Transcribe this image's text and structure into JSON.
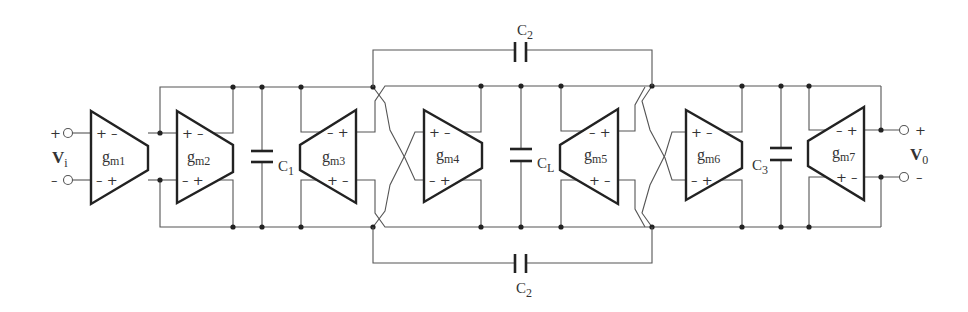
{
  "diagram": {
    "type": "circuit-schematic",
    "input": {
      "label": "V",
      "subscript": "i",
      "plus": "+",
      "minus": "–"
    },
    "output": {
      "label": "V",
      "subscript": "0",
      "plus": "+",
      "minus": "–"
    },
    "transconductors": [
      {
        "id": "gm1",
        "name": "g",
        "sub": "m1",
        "signs_top": "+ –",
        "signs_bottom": "– +"
      },
      {
        "id": "gm2",
        "name": "g",
        "sub": "m2",
        "signs_top": "+ –",
        "signs_bottom": "– +"
      },
      {
        "id": "gm3",
        "name": "g",
        "sub": "m3",
        "signs_top": "– +",
        "signs_bottom": "+ –"
      },
      {
        "id": "gm4",
        "name": "g",
        "sub": "m4",
        "signs_top": "+ –",
        "signs_bottom": "– +"
      },
      {
        "id": "gm5",
        "name": "g",
        "sub": "m5",
        "signs_top": "– +",
        "signs_bottom": "+ –"
      },
      {
        "id": "gm6",
        "name": "g",
        "sub": "m6",
        "signs_top": "+ –",
        "signs_bottom": "– +"
      },
      {
        "id": "gm7",
        "name": "g",
        "sub": "m7",
        "signs_top": "– +",
        "signs_bottom": "+ –"
      }
    ],
    "capacitors": [
      {
        "id": "C1",
        "name": "C",
        "sub": "1"
      },
      {
        "id": "CL",
        "name": "C",
        "sub": "L"
      },
      {
        "id": "C3",
        "name": "C",
        "sub": "3"
      },
      {
        "id": "C2_top",
        "name": "C",
        "sub": "2"
      },
      {
        "id": "C2_bottom",
        "name": "C",
        "sub": "2"
      }
    ]
  }
}
